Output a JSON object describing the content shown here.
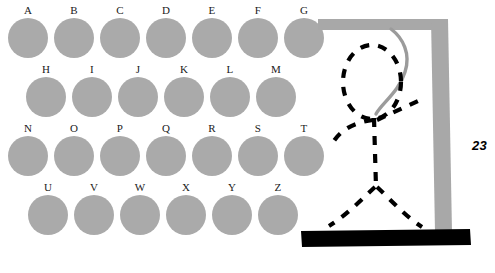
{
  "board": {
    "rows": [
      {
        "left": 8,
        "top": 4,
        "gap": 6,
        "letters": [
          "A",
          "B",
          "C",
          "D",
          "E",
          "F",
          "G"
        ]
      },
      {
        "left": 26,
        "top": 63,
        "gap": 6,
        "letters": [
          "H",
          "I",
          "J",
          "K",
          "L",
          "M"
        ]
      },
      {
        "left": 8,
        "top": 122,
        "gap": 6,
        "letters": [
          "N",
          "O",
          "P",
          "Q",
          "R",
          "S",
          "T"
        ]
      },
      {
        "left": 28,
        "top": 181,
        "gap": 6,
        "letters": [
          "U",
          "V",
          "W",
          "X",
          "Y",
          "Z"
        ]
      }
    ],
    "disc_color": "#aaaaaa",
    "label_color": "#1a1a1a"
  },
  "hangman": {
    "guesses_remaining": "23",
    "gallows_color": "#a8a8a8",
    "rope_color": "#9b9b9b",
    "base_color": "#000000",
    "figure_color": "#000000",
    "parts": [
      "head",
      "body",
      "left-arm",
      "right-arm",
      "left-leg",
      "right-leg"
    ]
  }
}
